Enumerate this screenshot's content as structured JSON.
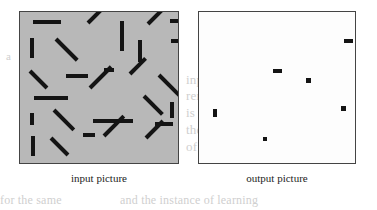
{
  "figure": {
    "input_panel": {
      "label": "input picture",
      "background_color": "#b8b8b8",
      "border_color": "#444444",
      "mark_color": "#141414",
      "segments": [
        {
          "x": 13,
          "y": 8,
          "len": 28,
          "angle": 0,
          "thick": 4
        },
        {
          "x": 68,
          "y": 9,
          "len": 26,
          "angle": -45,
          "thick": 4
        },
        {
          "x": 102,
          "y": 7,
          "len": 30,
          "angle": 90,
          "thick": 4
        },
        {
          "x": 128,
          "y": 10,
          "len": 22,
          "angle": -45,
          "thick": 4
        },
        {
          "x": 150,
          "y": 7,
          "len": 18,
          "angle": 0,
          "thick": 4
        },
        {
          "x": 12,
          "y": 24,
          "len": 20,
          "angle": 90,
          "thick": 4
        },
        {
          "x": 36,
          "y": 25,
          "len": 30,
          "angle": 45,
          "thick": 4
        },
        {
          "x": 120,
          "y": 26,
          "len": 22,
          "angle": 90,
          "thick": 4
        },
        {
          "x": 151,
          "y": 27,
          "len": 10,
          "angle": 0,
          "thick": 4
        },
        {
          "x": 10,
          "y": 57,
          "len": 24,
          "angle": 45,
          "thick": 4
        },
        {
          "x": 46,
          "y": 62,
          "len": 22,
          "angle": 0,
          "thick": 4
        },
        {
          "x": 84,
          "y": 56,
          "len": 10,
          "angle": 0,
          "thick": 4
        },
        {
          "x": 110,
          "y": 60,
          "len": 22,
          "angle": -45,
          "thick": 4
        },
        {
          "x": 139,
          "y": 61,
          "len": 30,
          "angle": 45,
          "thick": 4
        },
        {
          "x": 14,
          "y": 84,
          "len": 34,
          "angle": 0,
          "thick": 4
        },
        {
          "x": 70,
          "y": 74,
          "len": 30,
          "angle": -45,
          "thick": 4
        },
        {
          "x": 124,
          "y": 82,
          "len": 26,
          "angle": 45,
          "thick": 4
        },
        {
          "x": 152,
          "y": 88,
          "len": 16,
          "angle": 90,
          "thick": 4
        },
        {
          "x": 12,
          "y": 99,
          "len": 12,
          "angle": 90,
          "thick": 4
        },
        {
          "x": 34,
          "y": 96,
          "len": 28,
          "angle": 45,
          "thick": 4
        },
        {
          "x": 73,
          "y": 107,
          "len": 40,
          "angle": 0,
          "thick": 4
        },
        {
          "x": 135,
          "y": 110,
          "len": 18,
          "angle": 0,
          "thick": 4
        },
        {
          "x": 13,
          "y": 122,
          "len": 20,
          "angle": 90,
          "thick": 4
        },
        {
          "x": 31,
          "y": 124,
          "len": 24,
          "angle": 45,
          "thick": 4
        },
        {
          "x": 63,
          "y": 121,
          "len": 12,
          "angle": 0,
          "thick": 4
        },
        {
          "x": 84,
          "y": 122,
          "len": 28,
          "angle": -45,
          "thick": 4
        },
        {
          "x": 126,
          "y": 124,
          "len": 24,
          "angle": -45,
          "thick": 4
        }
      ],
      "segment_count": 27
    },
    "output_panel": {
      "label": "output picture",
      "background_color": "#fdfdfd",
      "border_color": "#444444",
      "mark_color": "#141414",
      "marks": [
        {
          "x": 145,
          "y": 27,
          "w": 9,
          "h": 4
        },
        {
          "x": 74,
          "y": 57,
          "w": 9,
          "h": 4
        },
        {
          "x": 107,
          "y": 66,
          "w": 5,
          "h": 5
        },
        {
          "x": 142,
          "y": 94,
          "w": 5,
          "h": 5
        },
        {
          "x": 14,
          "y": 97,
          "w": 4,
          "h": 8
        },
        {
          "x": 64,
          "y": 125,
          "w": 4,
          "h": 4
        }
      ],
      "mark_count": 6
    }
  },
  "page_bleed": [
    {
      "x": 6,
      "y": 50,
      "size": 11,
      "text": "a"
    },
    {
      "x": 186,
      "y": 72,
      "size": 13,
      "text": "inpt"
    },
    {
      "x": 186,
      "y": 88,
      "size": 13,
      "text": "remain"
    },
    {
      "x": 186,
      "y": 105,
      "size": 13,
      "text": "is"
    },
    {
      "x": 186,
      "y": 122,
      "size": 13,
      "text": "the"
    },
    {
      "x": 186,
      "y": 139,
      "size": 13,
      "text": "of"
    },
    {
      "x": 0,
      "y": 193,
      "size": 12,
      "text": "for the same"
    },
    {
      "x": 120,
      "y": 193,
      "size": 12,
      "text": "and the instance of learning"
    }
  ]
}
